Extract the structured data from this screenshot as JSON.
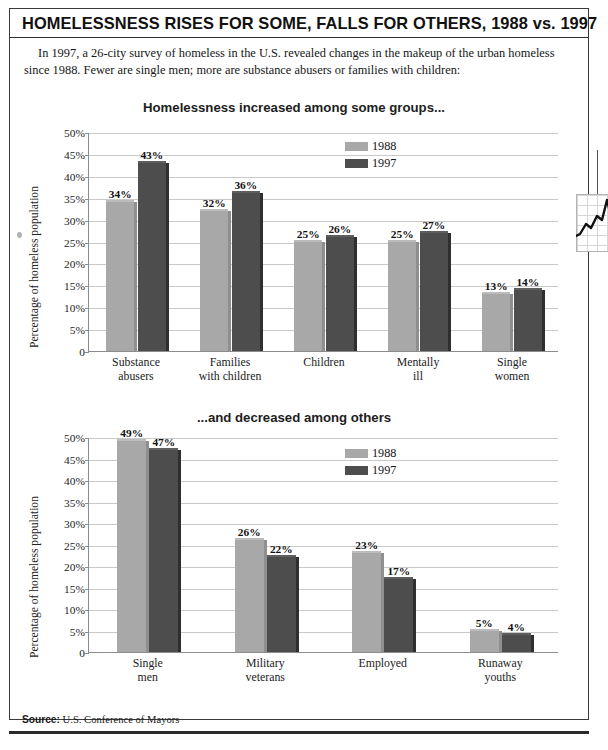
{
  "headline": "HOMELESSNESS RISES FOR SOME, FALLS FOR OTHERS, 1988 vs. 1997",
  "deck": "In 1997, a 26-city survey of homeless in the U.S. revealed changes in the makeup of the urban homeless since 1988. Fewer are single men; more are substance abusers or families with children:",
  "source": {
    "label": "Source:",
    "text": "U.S. Conference of Mayors"
  },
  "colors": {
    "series_1988": "#a8a8a8",
    "series_1997": "#4d4d4d",
    "gridline": "#c9c9c9",
    "axis": "#8c8c8c",
    "rule": "#2b2b2b"
  },
  "chart_data": [
    {
      "type": "bar",
      "title": "Homelessness increased among some groups...",
      "xlabel": "",
      "ylabel": "Percentage of homeless population",
      "ylim": [
        0,
        50
      ],
      "ytick_values": [
        0,
        5,
        10,
        15,
        20,
        25,
        30,
        35,
        40,
        45,
        50
      ],
      "ytick_labels": [
        "0",
        "5%",
        "10%",
        "15%",
        "20%",
        "25%",
        "30%",
        "35%",
        "40%",
        "45%",
        "50%"
      ],
      "grid": true,
      "legend_position": "upper-right",
      "categories": [
        "Substance abusers",
        "Families with children",
        "Children",
        "Mentally ill",
        "Single women"
      ],
      "series": [
        {
          "name": "1988",
          "values": [
            34,
            32,
            25,
            25,
            13
          ],
          "labels": [
            "34%",
            "32%",
            "25%",
            "25%",
            "13%"
          ]
        },
        {
          "name": "1997",
          "values": [
            43,
            36,
            26,
            27,
            14
          ],
          "labels": [
            "43%",
            "36%",
            "26%",
            "27%",
            "14%"
          ]
        }
      ]
    },
    {
      "type": "bar",
      "title": "...and decreased among others",
      "xlabel": "",
      "ylabel": "Percentage of homeless population",
      "ylim": [
        0,
        50
      ],
      "ytick_values": [
        0,
        5,
        10,
        15,
        20,
        25,
        30,
        35,
        40,
        45,
        50
      ],
      "ytick_labels": [
        "0",
        "5%",
        "10%",
        "15%",
        "20%",
        "25%",
        "30%",
        "35%",
        "40%",
        "45%",
        "50%"
      ],
      "grid": true,
      "legend_position": "upper-right",
      "categories": [
        "Single men",
        "Military veterans",
        "Employed",
        "Runaway youths"
      ],
      "series": [
        {
          "name": "1988",
          "values": [
            49,
            26,
            23,
            5
          ],
          "labels": [
            "49%",
            "26%",
            "23%",
            "5%"
          ]
        },
        {
          "name": "1997",
          "values": [
            47,
            22,
            17,
            4
          ],
          "labels": [
            "47%",
            "22%",
            "17%",
            "4%"
          ]
        }
      ]
    }
  ]
}
